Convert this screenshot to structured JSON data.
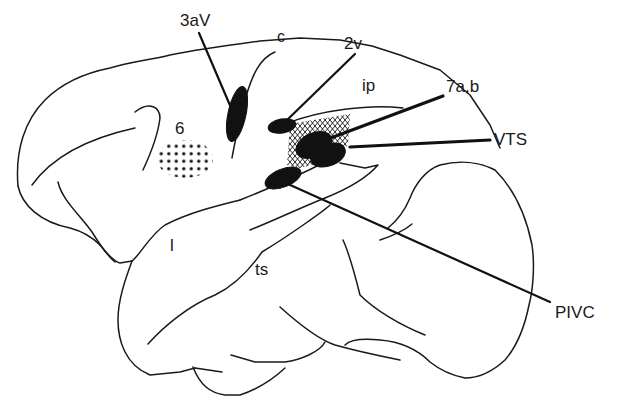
{
  "figure": {
    "colors": {
      "ink": "#1a1a1a",
      "background": "#ffffff",
      "fill": "#111111"
    }
  },
  "labels": {
    "area_3aV": "3aV",
    "sulcus_c": "c",
    "area_2v": "2v",
    "sulcus_ip": "ip",
    "area_7ab": "7a,b",
    "area_VTS": "VTS",
    "area_6": "6",
    "sulcus_l": "l",
    "sulcus_ts": "ts",
    "area_PIVC": "PIVC"
  },
  "regions": [
    {
      "id": "3aV",
      "style": "solid"
    },
    {
      "id": "2v",
      "style": "solid"
    },
    {
      "id": "7a,b",
      "style": "solid"
    },
    {
      "id": "VTS",
      "style": "solid"
    },
    {
      "id": "PIVC",
      "style": "solid"
    },
    {
      "id": "6",
      "style": "dotted"
    },
    {
      "id": "parietal-ip",
      "style": "crosshatched"
    }
  ]
}
